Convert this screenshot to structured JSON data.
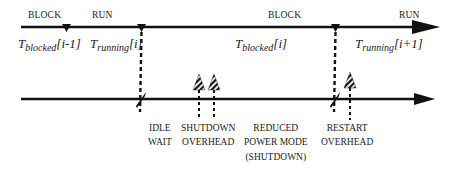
{
  "diagram": {
    "top_timeline": {
      "states": [
        "BLOCK",
        "RUN",
        "BLOCK",
        "RUN"
      ],
      "intervals": [
        {
          "symbol": "T",
          "subscript": "blocked",
          "index": "[i-1]"
        },
        {
          "symbol": "T",
          "subscript": "running",
          "index": "[i]"
        },
        {
          "symbol": "T",
          "subscript": "blocked",
          "index": "[i]"
        },
        {
          "symbol": "T",
          "subscript": "running",
          "index": "[i+1]"
        }
      ]
    },
    "bottom_timeline": {
      "phases": [
        {
          "line1": "IDLE",
          "line2": "WAIT"
        },
        {
          "line1": "SHUTDOWN",
          "line2": "OVERHEAD"
        },
        {
          "line1": "REDUCED",
          "line2": "POWER MODE",
          "line3": "(SHUTDOWN)"
        },
        {
          "line1": "RESTART",
          "line2": "OVERHEAD"
        }
      ]
    },
    "colors": {
      "line": "#111111",
      "background": "#ffffff"
    }
  }
}
